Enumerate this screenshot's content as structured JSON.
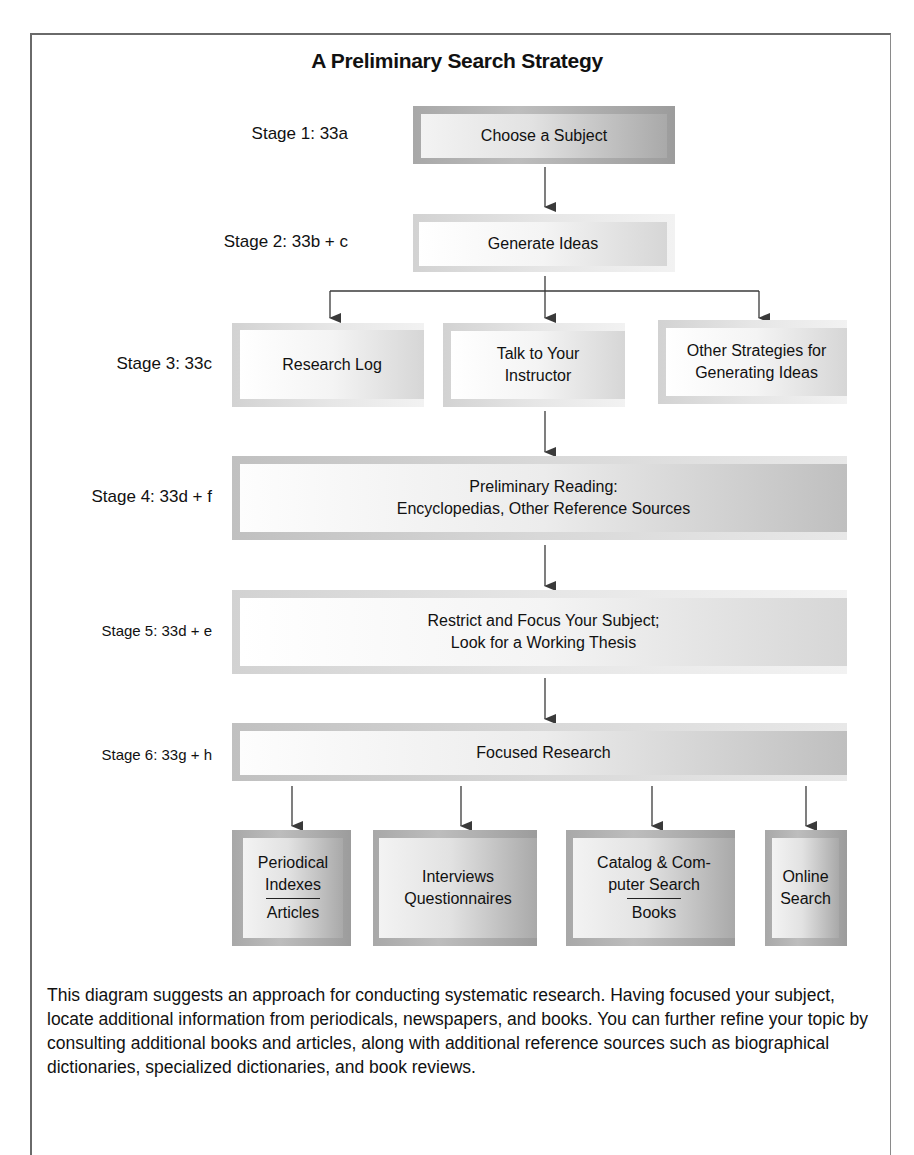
{
  "title": "A Preliminary Search Strategy",
  "stages": [
    {
      "label": "Stage 1: 33a",
      "boxes": [
        {
          "lines": [
            "Choose a Subject"
          ]
        }
      ]
    },
    {
      "label": "Stage 2: 33b + c",
      "boxes": [
        {
          "lines": [
            "Generate Ideas"
          ]
        }
      ]
    },
    {
      "label": "Stage 3: 33c",
      "boxes": [
        {
          "lines": [
            "Research Log"
          ]
        },
        {
          "lines": [
            "Talk to Your",
            "Instructor"
          ]
        },
        {
          "lines": [
            "Other Strategies for",
            "Generating Ideas"
          ]
        }
      ]
    },
    {
      "label": "Stage 4: 33d + f",
      "boxes": [
        {
          "lines": [
            "Preliminary Reading:",
            "Encyclopedias, Other Reference Sources"
          ]
        }
      ]
    },
    {
      "label": "Stage 5: 33d + e",
      "boxes": [
        {
          "lines": [
            "Restrict and Focus Your Subject;",
            "Look for a Working Thesis"
          ]
        }
      ]
    },
    {
      "label": "Stage 6: 33g + h",
      "boxes": [
        {
          "lines": [
            "Focused Research"
          ]
        }
      ]
    }
  ],
  "outcomes": [
    {
      "top": [
        "Periodical",
        "Indexes"
      ],
      "bottom": "Articles"
    },
    {
      "top": [
        "Interviews",
        "Questionnaires"
      ],
      "bottom": null
    },
    {
      "top": [
        "Catalog & Com-",
        "puter Search"
      ],
      "bottom": "Books"
    },
    {
      "top": [
        "Online",
        "Search"
      ],
      "bottom": null
    }
  ],
  "caption": "This diagram suggests an approach for conducting systematic research. Having focused your subject, locate additional information from periodicals, newspapers, and books. You can further refine your topic by consulting additional books and articles, along with additional reference sources such as biographical dictionaries, specialized dictionaries, and book reviews.",
  "colors": {
    "line": "#3a3a3a",
    "frame": "#6a6a6a"
  }
}
